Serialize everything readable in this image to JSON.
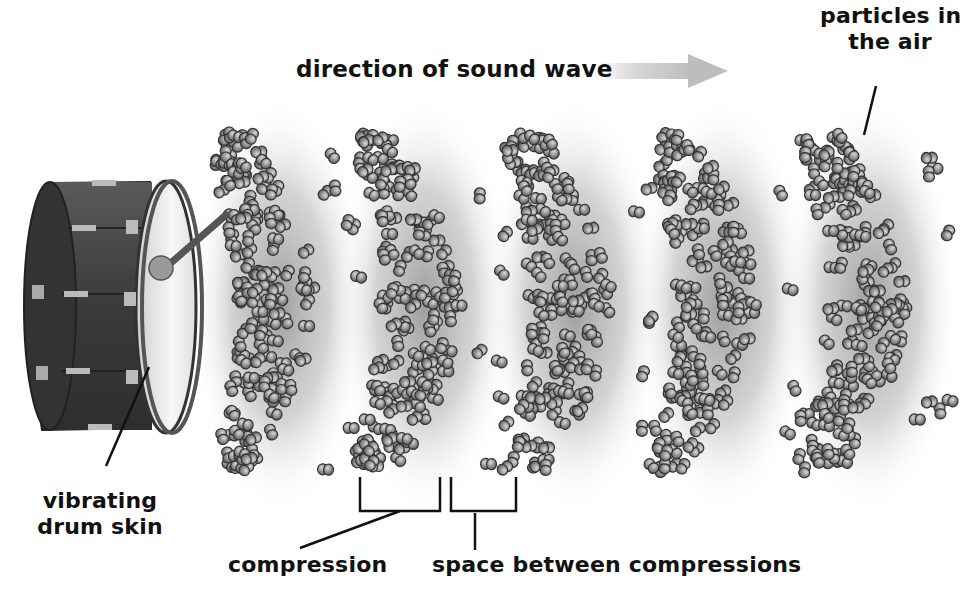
{
  "diagram": {
    "title": "",
    "colors": {
      "background": "#ffffff",
      "text": "#111111",
      "particle_fill": "#8a8a8a",
      "particle_stroke": "#3a3a3a",
      "compression_glow": "#9a9a9a",
      "arrow": "#c8c8c8",
      "drum_body": "#3f3f3f",
      "drum_skin": "#eeeeee"
    },
    "labels": {
      "direction": "direction of sound wave",
      "particles_line1": "particles in",
      "particles_line2": "the air",
      "drum_line1": "vibrating",
      "drum_line2": "drum skin",
      "compression": "compression",
      "space": "space between compressions"
    },
    "elements": {
      "drum": "bass drum with mallet",
      "arrow": "right-pointing arrow",
      "compressions_count": 5
    }
  }
}
